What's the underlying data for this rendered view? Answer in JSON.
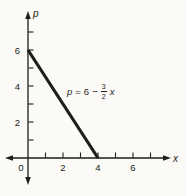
{
  "figure": {
    "background": "#fbfaf6",
    "ink": "#1d1d1b"
  },
  "chart_data": {
    "type": "line",
    "title": "",
    "xlabel": "x",
    "ylabel": "p",
    "xlim": [
      0,
      7.5
    ],
    "ylim": [
      0,
      7.5
    ],
    "grid": false,
    "legend": false,
    "x_ticks": [
      1,
      2,
      3,
      4,
      5,
      6,
      7
    ],
    "y_ticks": [
      1,
      2,
      3,
      4,
      5,
      6,
      7
    ],
    "x_labeled_ticks": [
      2,
      4,
      6
    ],
    "y_labeled_ticks": [
      2,
      4,
      6
    ],
    "origin_label": "0",
    "series": [
      {
        "name": "p = 6 − (3/2)x",
        "points": [
          [
            0,
            6
          ],
          [
            4,
            0
          ]
        ]
      }
    ],
    "equation": {
      "text": "p = 6 − (3/2)x",
      "lhs": "p",
      "rel": "=",
      "intercept": "6",
      "minus": "−",
      "frac_num": "3",
      "frac_den": "2",
      "variable": "x"
    }
  }
}
